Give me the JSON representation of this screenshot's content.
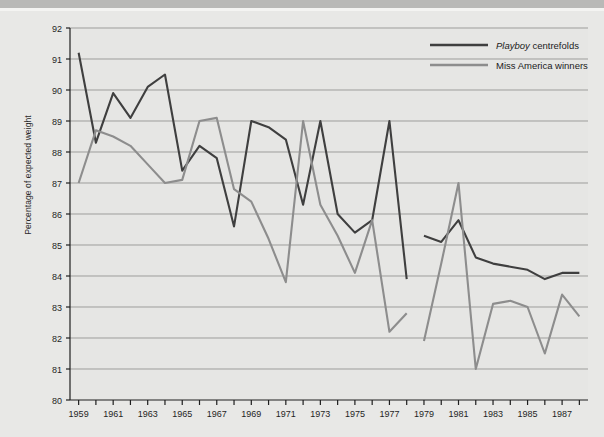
{
  "chart_data": {
    "type": "line",
    "title": "",
    "xlabel": "",
    "ylabel": "Percentage of expected weight",
    "xlim": [
      1958.5,
      1988.5
    ],
    "ylim": [
      80,
      92
    ],
    "yticks": [
      80,
      81,
      82,
      83,
      84,
      85,
      86,
      87,
      88,
      89,
      90,
      91,
      92
    ],
    "xticks": [
      1959,
      1960,
      1961,
      1962,
      1963,
      1964,
      1965,
      1966,
      1967,
      1968,
      1969,
      1970,
      1971,
      1972,
      1973,
      1974,
      1975,
      1976,
      1977,
      1978,
      1979,
      1980,
      1981,
      1982,
      1983,
      1984,
      1985,
      1986,
      1987,
      1988
    ],
    "xtick_labels": [
      "1959",
      "",
      "1961",
      "",
      "1963",
      "",
      "1965",
      "",
      "1967",
      "",
      "1969",
      "",
      "1971",
      "",
      "1973",
      "",
      "1975",
      "",
      "1977",
      "",
      "1979",
      "",
      "1981",
      "",
      "1983",
      "",
      "1985",
      "",
      "1987",
      ""
    ],
    "grid": "horizontal",
    "legend_position": "top-right",
    "series": [
      {
        "name": "Playboy centrefolds",
        "name_emphasis": "Playboy",
        "name_rest": " centrefolds",
        "color": "#3f3f3f",
        "x": [
          1959,
          1960,
          1961,
          1962,
          1963,
          1964,
          1965,
          1966,
          1967,
          1968,
          1969,
          1970,
          1971,
          1972,
          1973,
          1974,
          1975,
          1976,
          1977,
          1978
        ],
        "values": [
          91.2,
          88.3,
          89.9,
          89.1,
          90.1,
          90.5,
          87.4,
          88.2,
          87.8,
          85.6,
          89.0,
          88.8,
          88.4,
          86.3,
          89.0,
          86.0,
          85.4,
          85.8,
          89.0,
          83.9
        ],
        "x2": [
          1979,
          1980,
          1981,
          1982,
          1983,
          1984,
          1985,
          1986,
          1987,
          1988
        ],
        "values2": [
          85.3,
          85.1,
          85.8,
          84.6,
          84.4,
          84.3,
          84.2,
          83.9,
          84.1,
          84.1
        ]
      },
      {
        "name": "Miss America winners",
        "color": "#8d8d8d",
        "x": [
          1959,
          1960,
          1961,
          1962,
          1963,
          1964,
          1965,
          1966,
          1967,
          1968,
          1969,
          1970,
          1971,
          1972,
          1973,
          1974,
          1975,
          1976,
          1977,
          1978
        ],
        "values": [
          87.0,
          88.7,
          88.5,
          88.2,
          87.6,
          87.0,
          87.1,
          89.0,
          89.1,
          86.8,
          86.4,
          85.2,
          83.8,
          89.0,
          86.3,
          85.3,
          84.1,
          85.8,
          82.2,
          82.8
        ],
        "x2": [
          1979,
          1980,
          1981,
          1982,
          1983,
          1984,
          1985,
          1986,
          1987,
          1988
        ],
        "values2": [
          81.9,
          84.4,
          87.0,
          81.0,
          83.1,
          83.2,
          83.0,
          81.5,
          83.4,
          82.7
        ]
      }
    ]
  },
  "axis": {
    "ylabel": "Percentage of expected weight"
  },
  "legend": {
    "items": [
      {
        "emphasis": "Playboy",
        "rest": " centrefolds",
        "color": "#3f3f3f"
      },
      {
        "emphasis": "",
        "rest": "Miss America winners",
        "color": "#8d8d8d"
      }
    ]
  }
}
